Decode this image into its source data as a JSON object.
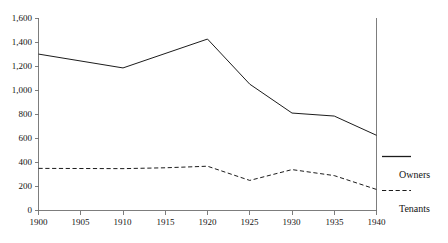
{
  "chart_data": {
    "type": "line",
    "title": "",
    "subtitle": "",
    "xlabel": "",
    "ylabel": "",
    "x": [
      1900,
      1905,
      1910,
      1915,
      1920,
      1925,
      1930,
      1935,
      1940
    ],
    "xlim": [
      1900,
      1940
    ],
    "ylim": [
      0,
      1600
    ],
    "grid": false,
    "legend_position": "right-outside",
    "xticks": [
      "1900",
      "1905",
      "1910",
      "1915",
      "1920",
      "1925",
      "1930",
      "1935",
      "1940"
    ],
    "yticks": [
      "0",
      "200",
      "400",
      "600",
      "800",
      "1,000",
      "1,200",
      "1,400",
      "1,600"
    ],
    "ytick_values": [
      0,
      200,
      400,
      600,
      800,
      1000,
      1200,
      1400,
      1600
    ],
    "series": [
      {
        "name": "Owners",
        "style": "solid",
        "color": "#1c1c1c",
        "x": [
          1900,
          1910,
          1920,
          1925,
          1930,
          1935,
          1940
        ],
        "values": [
          1300,
          1185,
          1425,
          1050,
          810,
          785,
          625
        ]
      },
      {
        "name": "Tenants",
        "style": "dashed",
        "color": "#1c1c1c",
        "x": [
          1900,
          1910,
          1915,
          1920,
          1925,
          1930,
          1935,
          1940
        ],
        "values": [
          350,
          348,
          355,
          368,
          250,
          340,
          290,
          175
        ]
      }
    ]
  },
  "legend": {
    "entries": [
      {
        "label": "Owners",
        "style": "solid"
      },
      {
        "label": "Tenants",
        "style": "dashed"
      }
    ]
  },
  "axes": {
    "y_tick_labels": [
      "1,600",
      "1,400",
      "1,200",
      "1,000",
      "800",
      "600",
      "400",
      "200",
      "0"
    ],
    "x_tick_labels": [
      "1900",
      "1905",
      "1910",
      "1915",
      "1920",
      "1925",
      "1930",
      "1935",
      "1940"
    ]
  }
}
